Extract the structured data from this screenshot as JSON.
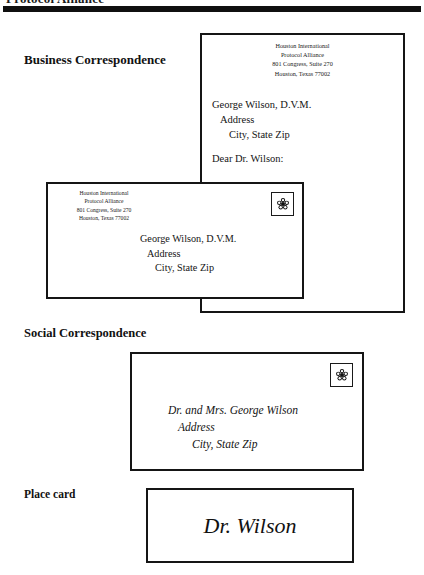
{
  "page": {
    "header_title": "Protocol Alliance",
    "rule_color": "#101010"
  },
  "sections": {
    "business": {
      "heading": "Business Correspondence",
      "letter": {
        "letterhead": [
          "Houston International",
          "Protocol Alliance",
          "801 Congress, Suite 270",
          "Houston, Texas 77002"
        ],
        "address": [
          "George Wilson, D.V.M.",
          "Address",
          "City, State Zip"
        ],
        "salutation": "Dear Dr. Wilson:"
      },
      "envelope": {
        "return_address": [
          "Houston International",
          "Protocol Alliance",
          "801 Congress, Suite 270",
          "Houston, Texas 77002"
        ],
        "address": [
          "George Wilson, D.V.M.",
          "Address",
          "City, State Zip"
        ],
        "stamp_icon": "flower-stamp-icon"
      }
    },
    "social": {
      "heading": "Social Correspondence",
      "envelope": {
        "address": [
          "Dr. and Mrs. George Wilson",
          "Address",
          "City, State Zip"
        ],
        "stamp_icon": "flower-stamp-icon"
      }
    },
    "place_card": {
      "heading": "Place card",
      "name": "Dr. Wilson"
    }
  }
}
